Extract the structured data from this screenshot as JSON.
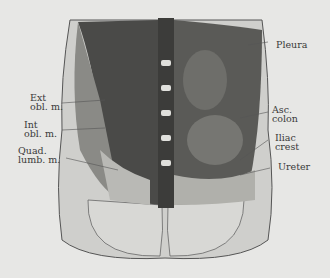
{
  "figure": {
    "labels_left": [
      {
        "line1": "Ext",
        "line2": "obl. m."
      },
      {
        "line1": "Int",
        "line2": "obl. m."
      },
      {
        "line1": "Quad.",
        "line2": "lumb. m."
      }
    ],
    "labels_right": [
      {
        "line1": "Pleura",
        "line2": ""
      },
      {
        "line1": "Asc.",
        "line2": "colon"
      },
      {
        "line1": "Iliac",
        "line2": "crest"
      },
      {
        "line1": "Ureter",
        "line2": ""
      }
    ]
  }
}
